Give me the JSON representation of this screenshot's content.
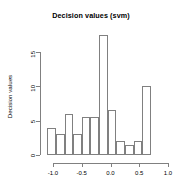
{
  "chart_data": {
    "type": "bar",
    "title": "Decision values (svm)",
    "xlabel": "",
    "ylabel": "Decision values",
    "grid": false,
    "legend": null,
    "xlim": [
      -1.18,
      1.02
    ],
    "ylim": [
      0,
      18.5
    ],
    "xticks": [
      "-1.0",
      "-0.5",
      "0.0",
      "0.5",
      "1.0"
    ],
    "xtick_values": [
      -1.0,
      -0.5,
      0.0,
      0.5,
      1.0
    ],
    "yticks": [
      "0",
      "5",
      "10",
      "15"
    ],
    "ytick_values": [
      0,
      5,
      10,
      15
    ],
    "bin_edges": [
      -1.1,
      -0.95,
      -0.8,
      -0.65,
      -0.5,
      -0.35,
      -0.2,
      -0.05,
      0.1,
      0.25,
      0.4,
      0.55,
      0.7,
      0.85,
      1.0
    ],
    "bars": [
      {
        "x0": -1.1,
        "x1": -0.95,
        "value": 4
      },
      {
        "x0": -0.95,
        "x1": -0.8,
        "value": 3
      },
      {
        "x0": -0.8,
        "x1": -0.65,
        "value": 6
      },
      {
        "x0": -0.65,
        "x1": -0.5,
        "value": 3
      },
      {
        "x0": -0.5,
        "x1": -0.35,
        "value": 5.5
      },
      {
        "x0": -0.35,
        "x1": -0.2,
        "value": 5.5
      },
      {
        "x0": -0.2,
        "x1": -0.05,
        "value": 17.5
      },
      {
        "x0": -0.05,
        "x1": 0.1,
        "value": 6.5
      },
      {
        "x0": 0.1,
        "x1": 0.25,
        "value": 2
      },
      {
        "x0": 0.25,
        "x1": 0.4,
        "value": 1.5
      },
      {
        "x0": 0.4,
        "x1": 0.55,
        "value": 2
      },
      {
        "x0": 0.55,
        "x1": 0.7,
        "value": 10
      }
    ],
    "values": [
      4,
      3,
      6,
      3,
      5.5,
      5.5,
      17.5,
      6.5,
      2,
      1.5,
      2,
      10
    ],
    "categories": [
      "-1.1..-0.95",
      "-0.95..-0.8",
      "-0.8..-0.65",
      "-0.65..-0.5",
      "-0.5..-0.35",
      "-0.35..-0.2",
      "-0.2..-0.05",
      "-0.05..0.1",
      "0.1..0.25",
      "0.25..0.4",
      "0.4..0.55",
      "0.55..0.7"
    ],
    "colors": {
      "bar_stroke": "#808080",
      "bar_fill": "transparent",
      "axis": "#808080",
      "text": "#000000",
      "background": "#ffffff"
    }
  }
}
